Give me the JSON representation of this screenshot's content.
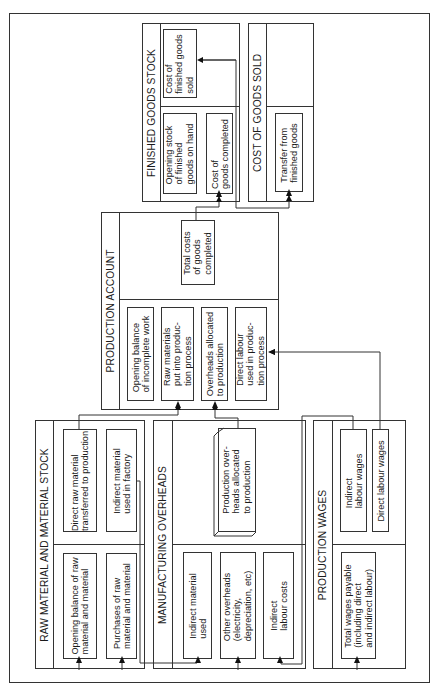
{
  "accounts": {
    "finished_goods_stock": {
      "title": "FINISHED GOODS STOCK",
      "items": {
        "cost_sold": "Cost of\nfinished goods\nsold",
        "opening_stock": "Opening stock\nof finished\ngoods on hand",
        "cost_completed": "Cost of\ngoods completed"
      }
    },
    "cost_of_goods_sold": {
      "title": "COST OF GOODS SOLD",
      "items": {
        "transfer": "Transfer from\nfinished goods"
      }
    },
    "production_account": {
      "title": "PRODUCTION ACCOUNT",
      "items": {
        "total_costs": "Total costs\nof goods\ncompleted",
        "opening_balance": "Opening balance\nof incomplete work",
        "raw_materials": "Raw materials\nput into produc-\ntion process",
        "overheads_allocated": "Overheads allocated\nto production",
        "direct_labour": "Direct labour\nused in produc-\ntion process"
      }
    },
    "raw_material_stock": {
      "title": "RAW MATERIAL AND MATERIAL STOCK",
      "items": {
        "direct_raw": "Direct raw material\ntransferred to production",
        "indirect_material": "Indirect material\nused in factory",
        "opening_balance": "Opening balance of raw\nmaterial and material",
        "purchases": "Purchases of raw\nmaterial and material"
      }
    },
    "manufacturing_overheads": {
      "title": "MANUFACTURING OVERHEADS",
      "items": {
        "production_overheads": "Production over-\nheads allocated\nto production",
        "indirect_material_used": "Indirect material\nused",
        "other_overheads": "Other overheads\n(electricity,\ndepreciation, etc)",
        "indirect_labour_costs": "Indirect\nlabour costs"
      }
    },
    "production_wages": {
      "title": "PRODUCTION WAGES",
      "items": {
        "indirect_labour_wages": "Indirect\nlabour wages",
        "direct_labour_wages": "Direct labour wages",
        "total_wages": "Total wages payable\n(including direct\nand indirect labour)"
      }
    }
  },
  "colors": {
    "line": "#333333",
    "background": "#ffffff"
  }
}
